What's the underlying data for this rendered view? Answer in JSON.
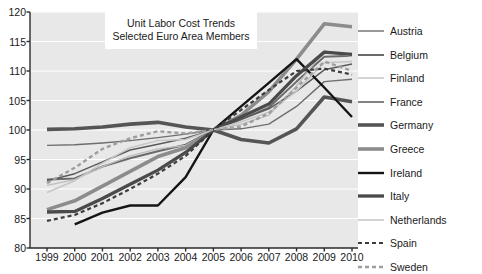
{
  "chart_data": {
    "type": "line",
    "title": "Unit Labor Cost Trends",
    "subtitle": "Selected Euro Area Members",
    "xlabel": "",
    "ylabel": "",
    "xlim": [
      1999,
      2010
    ],
    "ylim": [
      80,
      120
    ],
    "ytick_step": 5,
    "grid": true,
    "legend_position": "right",
    "plot_background": "#e8e8e8",
    "x": [
      1999,
      2000,
      2001,
      2002,
      2003,
      2004,
      2005,
      2006,
      2007,
      2008,
      2009,
      2010
    ],
    "xtick_labels": [
      "1999",
      "2000",
      "2001",
      "2002",
      "2003",
      "2004",
      "2005",
      "2006",
      "2007",
      "2008",
      "2009",
      "2010"
    ],
    "ytick_labels": [
      "80",
      "85",
      "90",
      "95",
      "100",
      "105",
      "110",
      "115",
      "120"
    ],
    "series": [
      {
        "name": "Austria",
        "color": "#6e6e6e",
        "width": 1.4,
        "dash": "none",
        "values": [
          97.4,
          97.5,
          97.8,
          98.2,
          98.7,
          99.3,
          100.0,
          100.2,
          101.0,
          104.0,
          108.2,
          108.6
        ]
      },
      {
        "name": "Belgium",
        "color": "#6a6a6a",
        "width": 2.0,
        "dash": "none",
        "values": [
          91.6,
          91.8,
          93.8,
          95.2,
          96.4,
          97.5,
          100.0,
          101.8,
          103.8,
          108.2,
          112.4,
          112.6
        ]
      },
      {
        "name": "Finland",
        "color": "#bdbdbd",
        "width": 1.3,
        "dash": "none",
        "values": [
          90.6,
          91.6,
          93.8,
          95.6,
          96.8,
          97.4,
          100.0,
          101.0,
          102.5,
          107.5,
          113.4,
          112.5
        ]
      },
      {
        "name": "France",
        "color": "#5a5a5a",
        "width": 1.5,
        "dash": "none",
        "values": [
          91.4,
          92.6,
          94.6,
          96.6,
          97.6,
          98.6,
          100.0,
          101.8,
          103.6,
          106.6,
          110.2,
          111.2
        ]
      },
      {
        "name": "Germany",
        "color": "#555555",
        "width": 3.6,
        "dash": "none",
        "values": [
          100.1,
          100.2,
          100.5,
          101.0,
          101.3,
          100.5,
          100.0,
          98.4,
          97.8,
          100.2,
          105.6,
          104.8
        ]
      },
      {
        "name": "Greece",
        "color": "#8c8c8c",
        "width": 3.6,
        "dash": "none",
        "values": [
          86.5,
          88.0,
          90.5,
          93.0,
          95.5,
          97.0,
          100.0,
          102.5,
          106.5,
          112.0,
          118.0,
          117.5
        ]
      },
      {
        "name": "Ireland",
        "color": "#141414",
        "width": 2.4,
        "dash": "none",
        "values": [
          null,
          84.0,
          86.0,
          87.2,
          87.2,
          92.0,
          100.0,
          104.0,
          108.0,
          112.0,
          107.2,
          102.2
        ]
      },
      {
        "name": "Italy",
        "color": "#4a4a4a",
        "width": 3.3,
        "dash": "none",
        "values": [
          86.1,
          86.2,
          88.4,
          90.8,
          93.2,
          96.2,
          100.0,
          102.2,
          104.4,
          109.2,
          113.2,
          112.8
        ]
      },
      {
        "name": "Netherlands",
        "color": "#c6c6c6",
        "width": 1.5,
        "dash": "none",
        "values": [
          89.4,
          91.4,
          94.4,
          97.0,
          98.2,
          98.4,
          100.0,
          101.4,
          103.0,
          106.6,
          111.4,
          111.6
        ]
      },
      {
        "name": "Spain",
        "color": "#3d3d3d",
        "width": 2.2,
        "dash": "4 3",
        "values": [
          84.6,
          85.6,
          87.6,
          90.0,
          92.6,
          95.6,
          100.0,
          103.4,
          106.8,
          110.0,
          110.4,
          109.4
        ]
      },
      {
        "name": "Sweden",
        "color": "#9e9e9e",
        "width": 2.4,
        "dash": "4 3",
        "values": [
          91.0,
          93.6,
          96.8,
          98.6,
          99.8,
          99.4,
          100.0,
          100.6,
          102.8,
          107.2,
          111.6,
          110.0
        ]
      }
    ]
  },
  "legend": {
    "items": [
      {
        "label": "Austria"
      },
      {
        "label": "Belgium"
      },
      {
        "label": "Finland"
      },
      {
        "label": "France"
      },
      {
        "label": "Germany"
      },
      {
        "label": "Greece"
      },
      {
        "label": "Ireland"
      },
      {
        "label": "Italy"
      },
      {
        "label": "Netherlands"
      },
      {
        "label": "Spain"
      },
      {
        "label": "Sweden"
      }
    ]
  }
}
